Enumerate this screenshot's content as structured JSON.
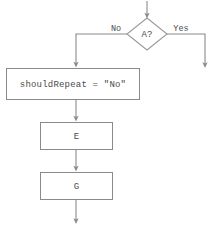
{
  "diagram": {
    "type": "flowchart",
    "title": "",
    "colors": {
      "background": "#ffffff",
      "stroke": "#8a8a8a",
      "diamond_stroke": "#9a9a9a",
      "text": "#4a4a4a",
      "node_fill": "#ffffff"
    },
    "nodes": [
      {
        "id": "decision-a",
        "shape": "diamond",
        "label": "A?",
        "x": 147,
        "y": 34,
        "width": 40,
        "height": 32
      },
      {
        "id": "statement-shouldrepeat",
        "shape": "rectangle",
        "label": "shouldRepeat = \"No\"",
        "x": 6,
        "y": 68,
        "width": 134,
        "height": 32
      },
      {
        "id": "process-e",
        "shape": "rectangle",
        "label": "E",
        "x": 40,
        "y": 122,
        "width": 73,
        "height": 28
      },
      {
        "id": "process-g",
        "shape": "rectangle",
        "label": "G",
        "x": 40,
        "y": 172,
        "width": 73,
        "height": 28
      }
    ],
    "edges": [
      {
        "id": "entry-to-decision",
        "from": "entry",
        "to": "decision-a",
        "label": ""
      },
      {
        "id": "decision-no-branch",
        "from": "decision-a",
        "to": "statement-shouldrepeat",
        "label": "No"
      },
      {
        "id": "decision-yes-branch",
        "from": "decision-a",
        "to": "exit-right",
        "label": "Yes"
      },
      {
        "id": "statement-to-e",
        "from": "statement-shouldrepeat",
        "to": "process-e",
        "label": ""
      },
      {
        "id": "e-to-g",
        "from": "process-e",
        "to": "process-g",
        "label": ""
      },
      {
        "id": "g-to-exit",
        "from": "process-g",
        "to": "exit-bottom",
        "label": ""
      }
    ],
    "labels": {
      "no": "No",
      "yes": "Yes",
      "decision_a": "A?",
      "statement": "shouldRepeat = \"No\"",
      "process_e": "E",
      "process_g": "G"
    }
  }
}
